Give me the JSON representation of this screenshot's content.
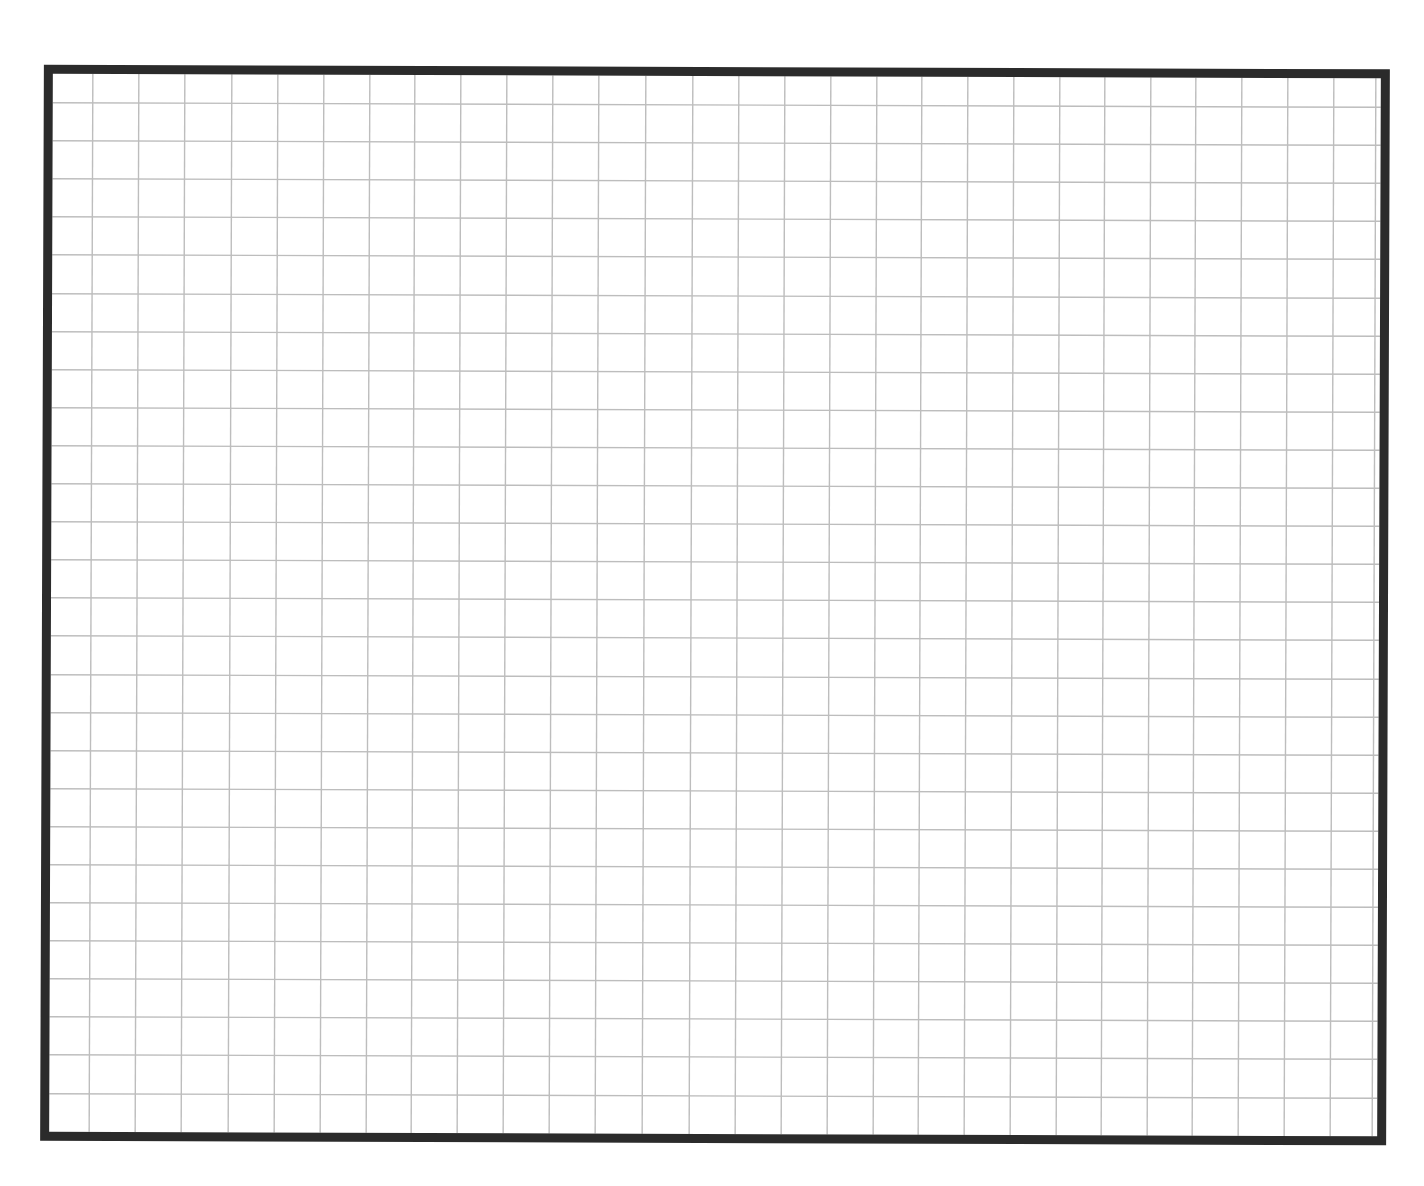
{
  "sheet": {
    "type": "blank-grid-paper",
    "background_color": "#ffffff",
    "rotation_deg": 0.2,
    "frame": {
      "left": 42,
      "top": 67,
      "right": 1388,
      "bottom": 1143,
      "stroke_width": 9,
      "color": "#2b2b2b"
    },
    "grid": {
      "line_color": "#bdbdbd",
      "line_width": 1.4,
      "vertical_lines_x": [
        91,
        137,
        183,
        230,
        276,
        322,
        368,
        413,
        459,
        505,
        551,
        597,
        644,
        691,
        737,
        783,
        829,
        875,
        920,
        966,
        1012,
        1058,
        1103,
        1149,
        1194,
        1240,
        1286,
        1332,
        1374
      ],
      "horizontal_lines_y": [
        105,
        143,
        181,
        219,
        257,
        296,
        334,
        372,
        410,
        448,
        486,
        524,
        562,
        600,
        638,
        677,
        715,
        753,
        791,
        829,
        867,
        905,
        943,
        981,
        1019,
        1057,
        1096
      ],
      "columns": 29,
      "rows": 28
    }
  }
}
